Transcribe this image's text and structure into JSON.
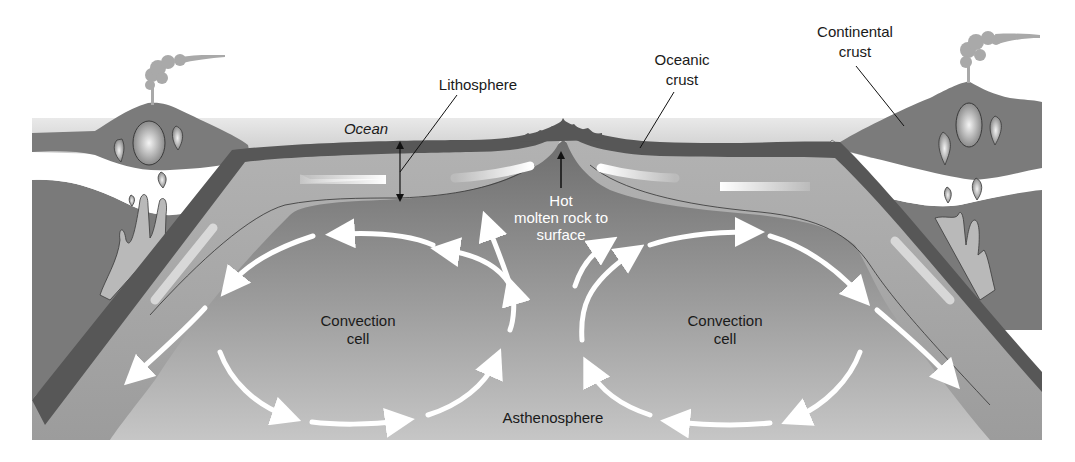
{
  "diagram": {
    "labels": {
      "lithosphere": "Lithosphere",
      "ocean": "Ocean",
      "oceanic_crust_line1": "Oceanic",
      "oceanic_crust_line2": "crust",
      "continental_crust_line1": "Continental",
      "continental_crust_line2": "crust",
      "hot_rock_line1": "Hot",
      "hot_rock_line2": "molten rock to",
      "hot_rock_line3": "surface",
      "convection_left_line1": "Convection",
      "convection_left_line2": "cell",
      "convection_right_line1": "Convection",
      "convection_right_line2": "cell",
      "asthenosphere": "Asthenosphere"
    },
    "colors": {
      "background": "#ffffff",
      "ocean_water": "#d4d4d4",
      "crust_dark": "#575757",
      "continent": "#7a7a7a",
      "lithosphere_plate": "#a8a8a8",
      "asthenosphere_top": "#7c7c7c",
      "asthenosphere_bottom": "#c4c4c4",
      "arrow": "#ffffff",
      "label_text": "#1a1a1a"
    }
  }
}
